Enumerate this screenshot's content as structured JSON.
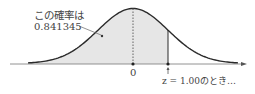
{
  "figure": {
    "type": "normal-distribution-diagram",
    "annotation_line1": "この確率は",
    "annotation_line2": "0.841345",
    "zero_label": "0",
    "z_label": "z = 1.00のとき…",
    "shaded_upto_z": 1.0,
    "probability": 0.841345,
    "colors": {
      "curve": "#2a2a2a",
      "shade": "#e6e6e6",
      "axis": "#555555",
      "text": "#444444"
    }
  }
}
